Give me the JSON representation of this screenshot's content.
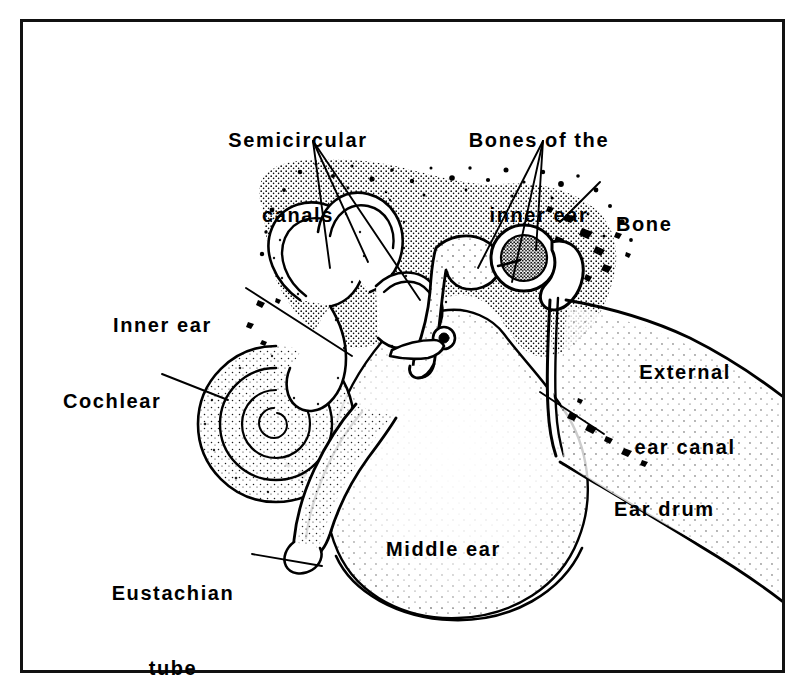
{
  "figure": {
    "frame_color": "#111111",
    "background_color": "#ffffff",
    "ink_color": "#000000"
  },
  "labels": [
    {
      "id": "semicircular-canals",
      "text": "Semicircular\ncanals",
      "line1": "Semicircular",
      "line2": "canals"
    },
    {
      "id": "bones-inner-ear",
      "text": "Bones of the\ninner ear",
      "line1": "Bones of the",
      "line2": "inner ear"
    },
    {
      "id": "bone",
      "text": "Bone",
      "line1": "Bone",
      "line2": ""
    },
    {
      "id": "inner-ear",
      "text": "Inner ear",
      "line1": "Inner ear",
      "line2": ""
    },
    {
      "id": "cochlear",
      "text": "Cochlear",
      "line1": "Cochlear",
      "line2": ""
    },
    {
      "id": "external-ear-canal",
      "text": "External\near canal",
      "line1": "External",
      "line2": "ear canal"
    },
    {
      "id": "ear-drum",
      "text": "Ear drum",
      "line1": "Ear drum",
      "line2": ""
    },
    {
      "id": "middle-ear",
      "text": "Middle ear",
      "line1": "Middle ear",
      "line2": ""
    },
    {
      "id": "eustachian-tube",
      "text": "Eustachian\ntube",
      "line1": "Eustachian",
      "line2": "tube"
    }
  ],
  "caption_fragment": ""
}
